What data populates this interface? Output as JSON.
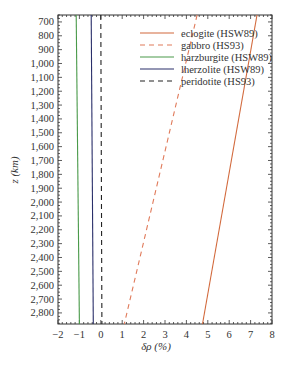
{
  "chart_data": {
    "type": "line",
    "title": "",
    "xlabel": "δρ (%)",
    "ylabel": "z (km)",
    "xlim": [
      -2,
      8
    ],
    "ylim": [
      650,
      2880
    ],
    "y_inverted": true,
    "x_ticks": [
      "−2",
      "−1",
      "0",
      "1",
      "2",
      "3",
      "4",
      "5",
      "6",
      "7",
      "8"
    ],
    "y_ticks": [
      "700",
      "800",
      "900",
      "1,000",
      "1,100",
      "1,200",
      "1,300",
      "1,400",
      "1,500",
      "1,600",
      "1,700",
      "1,800",
      "1,900",
      "2,000",
      "2,100",
      "2,200",
      "2,300",
      "2,400",
      "2,500",
      "2,600",
      "2,700",
      "2,800"
    ],
    "grid": false,
    "legend_position": "upper right",
    "series": [
      {
        "name": "eclogite (HSW89)",
        "style": "solid",
        "color": "#d2693c",
        "points": [
          [
            7.3,
            650
          ],
          [
            4.75,
            2880
          ]
        ]
      },
      {
        "name": "gabbro (HS93)",
        "style": "dashed",
        "color": "#e07a5a",
        "points": [
          [
            4.5,
            650
          ],
          [
            1.1,
            2880
          ]
        ]
      },
      {
        "name": "harzburgite (HSW89)",
        "style": "solid",
        "color": "#4a9a4a",
        "points": [
          [
            -1.15,
            650
          ],
          [
            -1.0,
            2880
          ]
        ]
      },
      {
        "name": "lherzolite (HSW89)",
        "style": "solid",
        "color": "#2a2f6a",
        "points": [
          [
            -0.45,
            650
          ],
          [
            -0.35,
            2880
          ]
        ]
      },
      {
        "name": "peridotite (HS93)",
        "style": "dashed",
        "color": "#222222",
        "points": [
          [
            0.0,
            650
          ],
          [
            0.05,
            2880
          ]
        ]
      }
    ]
  }
}
